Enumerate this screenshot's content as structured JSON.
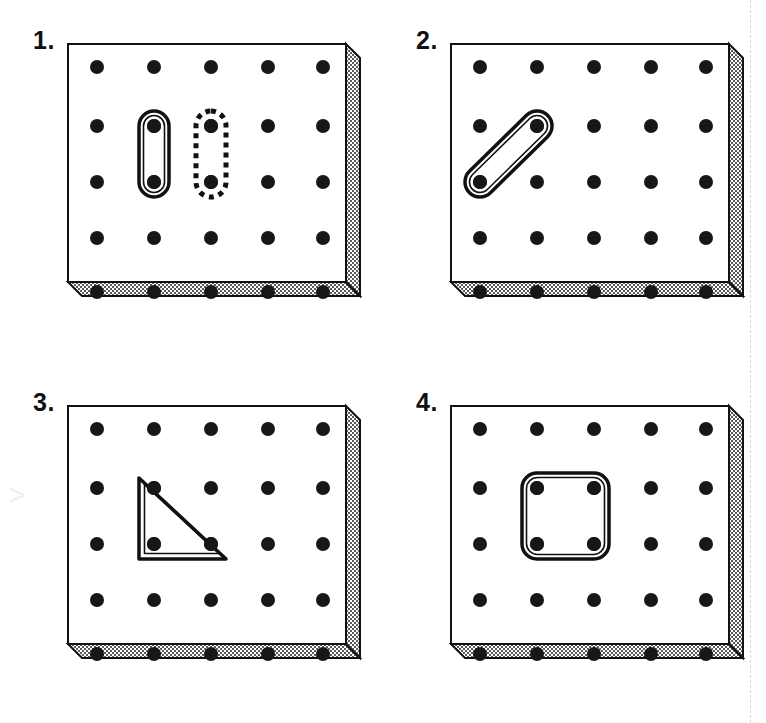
{
  "page": {
    "width": 766,
    "height": 723,
    "background_color": "#ffffff",
    "fold_line": "dashed vertical guide at right margin",
    "watermark_glyph": ">"
  },
  "colors": {
    "ink": "#111111",
    "board_face": "#ffffff",
    "board_edge_fill": "#d9d9d9",
    "peg": "#171717",
    "band": "#111111",
    "fold_line": "#d8d8d8",
    "watermark": "#f0f0f0"
  },
  "board": {
    "grid_rows": 5,
    "grid_cols": 5,
    "peg_count": 25,
    "peg_radius_px": 7,
    "spacing_px": 57,
    "description": "Five-by-five peg geoboard drawn in isometric relief with a stippled right side panel and stippled bottom panel."
  },
  "panels": [
    {
      "id": "panel-1",
      "label": "1.",
      "bands": [
        {
          "name": "solid-vertical-band",
          "style": "solid",
          "shape": "segment",
          "pegs": [
            [
              1,
              1
            ],
            [
              2,
              1
            ]
          ],
          "description": "Solid rubber band stretched vertically between two pegs in column 2, rows 2 and 3."
        },
        {
          "name": "dashed-vertical-band",
          "style": "dashed",
          "shape": "segment",
          "pegs": [
            [
              1,
              2
            ],
            [
              2,
              2
            ]
          ],
          "description": "Dashed outline showing the same vertical band shape on column 3, rows 2 and 3."
        }
      ]
    },
    {
      "id": "panel-2",
      "label": "2.",
      "bands": [
        {
          "name": "diagonal-band",
          "style": "solid",
          "shape": "segment",
          "pegs": [
            [
              2,
              0
            ],
            [
              1,
              1
            ]
          ],
          "description": "Solid rubber band stretched diagonally from row 3 column 1 up to row 2 column 2."
        }
      ]
    },
    {
      "id": "panel-3",
      "label": "3.",
      "bands": [
        {
          "name": "right-triangle-band",
          "style": "solid",
          "shape": "triangle",
          "pegs": [
            [
              1,
              1
            ],
            [
              2,
              1
            ],
            [
              2,
              2
            ]
          ],
          "description": "Solid rubber band forming a right triangle with the right angle at row 3 column 2."
        }
      ]
    },
    {
      "id": "panel-4",
      "label": "4.",
      "bands": [
        {
          "name": "square-band",
          "style": "solid",
          "shape": "quadrilateral",
          "pegs": [
            [
              1,
              1
            ],
            [
              1,
              2
            ],
            [
              2,
              2
            ],
            [
              2,
              1
            ]
          ],
          "description": "Solid rubber band forming a square around four pegs spanning rows 2-3 and columns 2-3."
        }
      ]
    }
  ]
}
